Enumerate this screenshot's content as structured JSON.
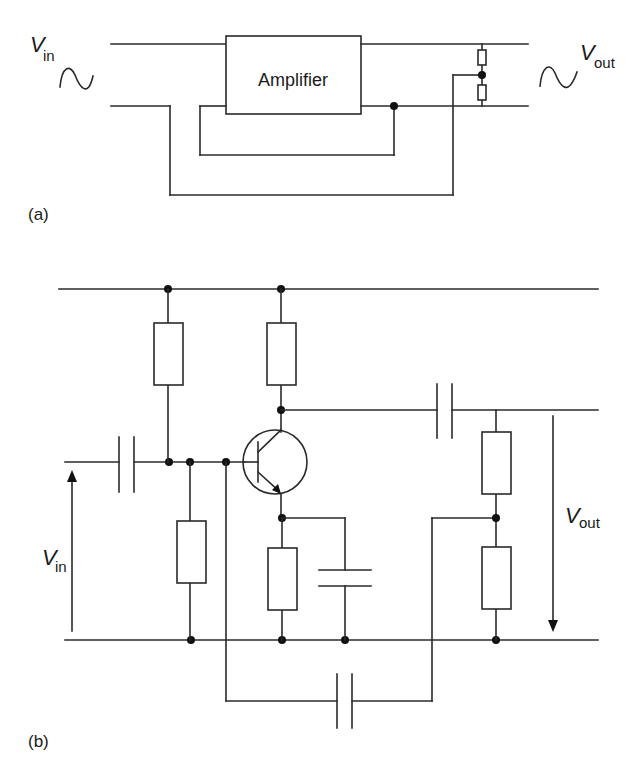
{
  "figure_a": {
    "panel_label": "(a)",
    "block_label": "Amplifier",
    "input_label": {
      "main": "V",
      "sub": "in"
    },
    "output_label": {
      "main": "V",
      "sub": "out"
    },
    "input_icon": "sine-wave-icon",
    "output_icon": "sine-wave-icon",
    "components": [
      "amplifier-block",
      "resistor-divider-top",
      "resistor-divider-bottom"
    ]
  },
  "figure_b": {
    "panel_label": "(b)",
    "input_label": {
      "main": "V",
      "sub": "in"
    },
    "output_label": {
      "main": "V",
      "sub": "out"
    },
    "components": [
      "input-coupling-capacitor",
      "bias-resistor-top",
      "bias-resistor-bottom",
      "collector-resistor",
      "npn-transistor",
      "emitter-resistor",
      "emitter-bypass-capacitor",
      "output-coupling-capacitor",
      "feedback-divider-resistor-top",
      "feedback-divider-resistor-bottom",
      "feedback-capacitor"
    ]
  },
  "colors": {
    "line": "#2a2a2a",
    "background": "#ffffff"
  }
}
